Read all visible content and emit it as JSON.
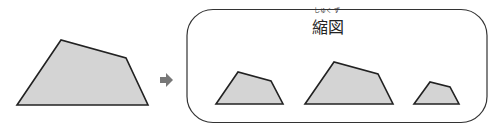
{
  "diagram": {
    "title": "縮図",
    "ruby": {
      "first": "しゅく",
      "second": "ず"
    },
    "arrow_icon": "right-arrow-icon",
    "shapes": {
      "original": "17,105 61,40 126,58 148,105",
      "reduced": [
        "216,104 238,72 271,81 283,104",
        "305,104 334,62 378,74 393,104",
        "414,104 430,82 450,87 459,104"
      ]
    },
    "colors": {
      "fill": "#d4d4d4",
      "stroke": "#222222",
      "arrow": "#777777"
    }
  }
}
